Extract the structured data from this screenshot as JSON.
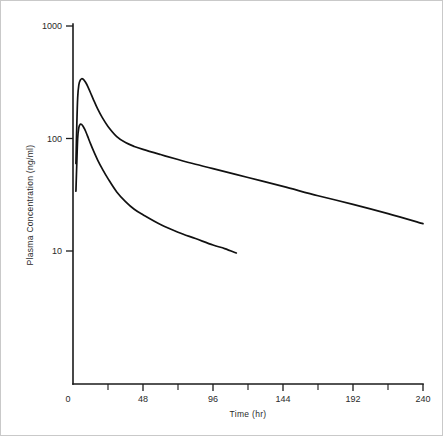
{
  "chart_data": {
    "type": "line",
    "title": "",
    "xlabel": "Time (hr)",
    "ylabel": "Plasma Concentration (ng/ml)",
    "yscale": "log",
    "xscale": "linear",
    "xlim": [
      0,
      240
    ],
    "ylim": [
      10,
      1000
    ],
    "grid": false,
    "legend": "none",
    "x_ticks": [
      0,
      48,
      96,
      144,
      192,
      240
    ],
    "x_tick_labels": [
      "0",
      "48",
      "96",
      "144",
      "192",
      "240"
    ],
    "x_minor_ticks": [
      24,
      72,
      120,
      168,
      216
    ],
    "y_ticks": [
      10,
      100,
      1000
    ],
    "y_tick_labels": [
      "10",
      "100",
      "1000"
    ],
    "series": [
      {
        "name": "upper-curve",
        "x": [
          2.0,
          2.6,
          3.2,
          4.0,
          5.0,
          6.0,
          7.0,
          8.0,
          9.0,
          10.0,
          12.0,
          14.0,
          17.0,
          20.0,
          24.0,
          30.0,
          36.0,
          42.0,
          48.0,
          60.0,
          72.0,
          84.0,
          96.0,
          120.0,
          144.0,
          168.0,
          192.0,
          216.0,
          240.0
        ],
        "y": [
          60.0,
          130.0,
          230.0,
          300.0,
          330.0,
          340.0,
          336.0,
          325.0,
          310.0,
          292.0,
          255.0,
          222.0,
          182.0,
          154.0,
          128.0,
          104.0,
          92.0,
          85.0,
          80.0,
          72.0,
          65.0,
          59.0,
          54.0,
          45.0,
          37.5,
          31.0,
          26.0,
          21.5,
          17.5
        ],
        "color": "#111111"
      },
      {
        "name": "lower-curve",
        "x": [
          2.0,
          2.6,
          3.2,
          4.0,
          5.0,
          6.0,
          7.0,
          8.0,
          9.0,
          10.0,
          12.0,
          14.0,
          17.0,
          20.0,
          24.0,
          30.0,
          36.0,
          42.0,
          48.0,
          60.0,
          72.0,
          84.0,
          96.0,
          104.0,
          112.0
        ],
        "y": [
          34.0,
          60.0,
          100.0,
          125.0,
          134.0,
          133.0,
          128.0,
          121.0,
          113.0,
          105.0,
          90.0,
          78.0,
          64.0,
          54.0,
          44.0,
          33.5,
          27.5,
          23.5,
          21.0,
          17.2,
          14.7,
          12.9,
          11.3,
          10.5,
          9.6
        ],
        "color": "#111111"
      }
    ]
  },
  "axes": {
    "x_title": "Time (hr)",
    "y_title": "Plasma Concentration (ng/ml)"
  }
}
